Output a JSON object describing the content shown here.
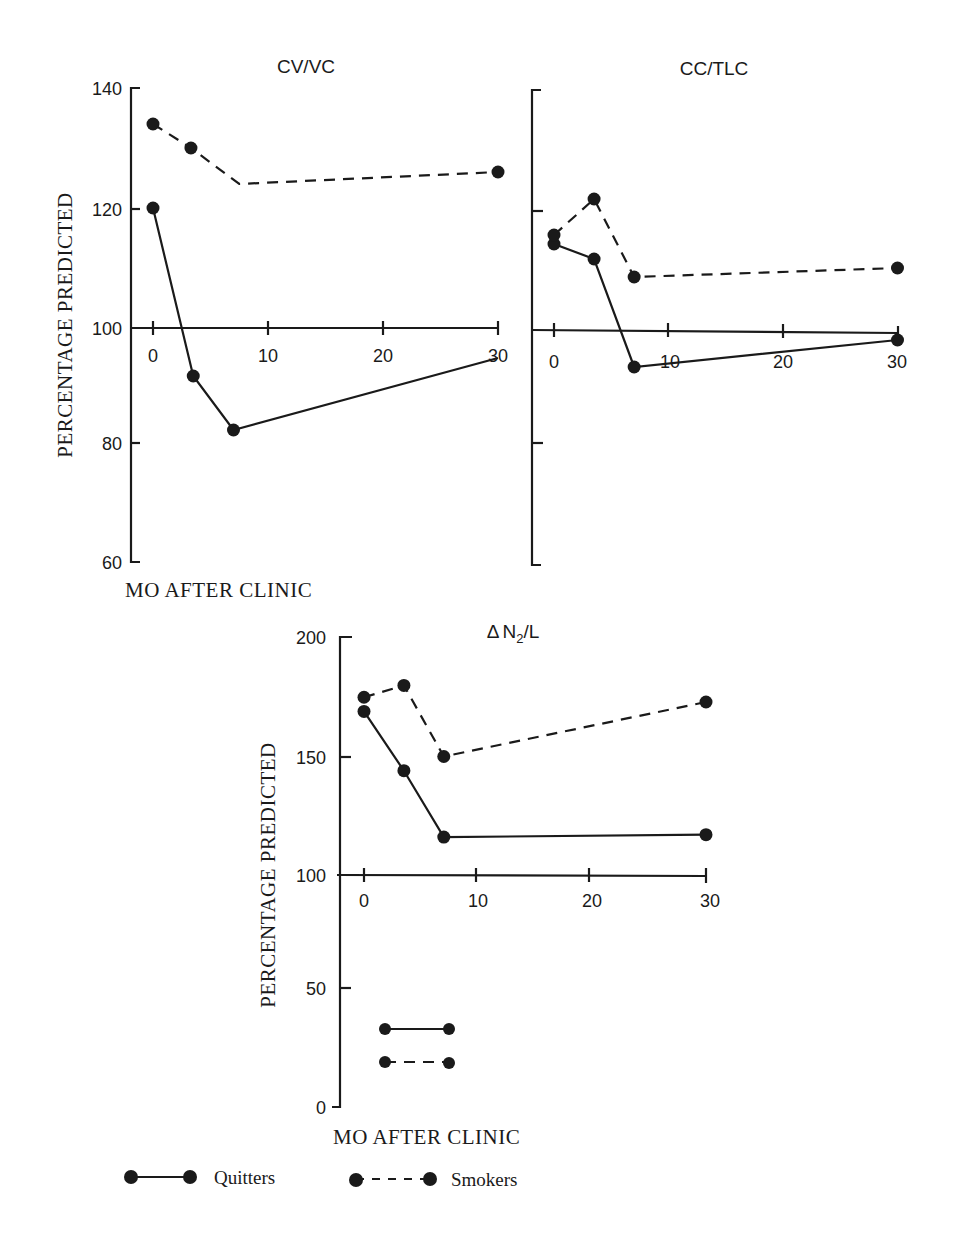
{
  "chart_data": [
    {
      "id": "cv_vc",
      "type": "line",
      "title": "CV/VC",
      "ylabel": "PERCENTAGE PREDICTED",
      "xlabel": "MO AFTER CLINIC",
      "ylim": [
        60,
        140
      ],
      "yticks": [
        60,
        80,
        100,
        120,
        140
      ],
      "ytick_labels_shown": true,
      "xticks": [
        0,
        10,
        20,
        30
      ],
      "x_axis_at_y": 100,
      "grid": false,
      "series": [
        {
          "name": "Quitters",
          "style": "solid",
          "points": [
            [
              0,
              120
            ],
            [
              3.5,
              92
            ],
            [
              7,
              83
            ],
            [
              30,
              95
            ]
          ],
          "markers": [
            true,
            true,
            true,
            false
          ]
        },
        {
          "name": "Smokers",
          "style": "dashed",
          "points": [
            [
              0,
              134
            ],
            [
              3.3,
              130
            ],
            [
              7.5,
              124
            ],
            [
              30,
              126
            ]
          ],
          "markers": [
            true,
            true,
            false,
            true
          ]
        }
      ]
    },
    {
      "id": "cc_tlc",
      "type": "line",
      "title": "CC/TLC",
      "ylabel": "",
      "xlabel": "",
      "ylim": [
        60,
        140
      ],
      "yticks": [
        60,
        80,
        100,
        120,
        140
      ],
      "ytick_labels_shown": false,
      "xticks": [
        0,
        10,
        20,
        30
      ],
      "x_axis_at_y": 100,
      "grid": false,
      "series": [
        {
          "name": "Quitters",
          "style": "solid",
          "points": [
            [
              0,
              114.5
            ],
            [
              3.5,
              112
            ],
            [
              7,
              94
            ],
            [
              30,
              98.5
            ]
          ],
          "markers": [
            true,
            true,
            true,
            true
          ]
        },
        {
          "name": "Smokers",
          "style": "dashed",
          "points": [
            [
              0,
              116
            ],
            [
              3.5,
              122
            ],
            [
              7,
              109
            ],
            [
              30,
              110.5
            ]
          ],
          "markers": [
            true,
            true,
            true,
            true
          ]
        }
      ]
    },
    {
      "id": "dn2_l",
      "type": "line",
      "title": "ΔN2/L",
      "ylabel": "PERCENTAGE PREDICTED",
      "xlabel": "MO AFTER CLINIC",
      "ylim": [
        0,
        200
      ],
      "yticks": [
        0,
        50,
        100,
        150,
        200
      ],
      "ytick_labels_shown": true,
      "xticks": [
        0,
        10,
        20,
        30
      ],
      "x_axis_at_y": 100,
      "grid": false,
      "series": [
        {
          "name": "Quitters",
          "style": "solid",
          "points": [
            [
              0,
              169
            ],
            [
              3.5,
              144
            ],
            [
              7,
              116
            ],
            [
              30,
              117
            ]
          ],
          "markers": [
            true,
            true,
            true,
            true
          ]
        },
        {
          "name": "Smokers",
          "style": "dashed",
          "points": [
            [
              0,
              175
            ],
            [
              3.5,
              180
            ],
            [
              7,
              150
            ],
            [
              30,
              173
            ]
          ],
          "markers": [
            true,
            true,
            true,
            true
          ]
        }
      ]
    }
  ],
  "labels": {
    "cv_vc_title": "CV/VC",
    "cc_tlc_title": "CC/TLC",
    "dn2_title_delta": "Δ",
    "dn2_title_n": "N",
    "dn2_title_sub": "2",
    "dn2_title_rest": "/L",
    "ylabel": "PERCENTAGE PREDICTED",
    "xlabel": "MO AFTER CLINIC",
    "ytick_top": [
      "140",
      "120",
      "100",
      "80",
      "60"
    ],
    "ytick_bottom": [
      "200",
      "150",
      "100",
      "50",
      "0"
    ],
    "xtick": [
      "0",
      "10",
      "20",
      "30"
    ]
  },
  "legend": {
    "position": "bottom-left",
    "items": [
      {
        "label": "Quitters",
        "style": "solid"
      },
      {
        "label": "Smokers",
        "style": "dashed"
      }
    ]
  },
  "colors": {
    "ink": "#1a1a1a",
    "background": "#ffffff"
  }
}
